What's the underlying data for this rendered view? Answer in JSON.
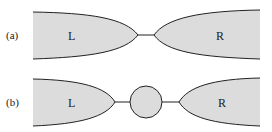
{
  "diagram": {
    "fill_color": "#dcdcdc",
    "stroke_color": "#222222",
    "panels": [
      {
        "label": "(a)",
        "left_label": "L",
        "right_label": "R",
        "connector": "wire"
      },
      {
        "label": "(b)",
        "left_label": "L",
        "right_label": "R",
        "connector": "wire-with-dot"
      }
    ]
  }
}
